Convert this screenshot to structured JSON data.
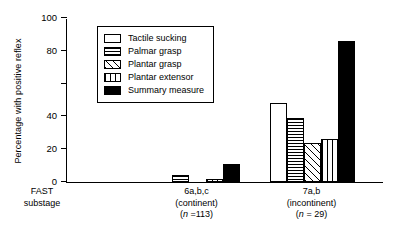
{
  "chart_data": {
    "type": "bar",
    "title": "",
    "xlabel": "FAST substage",
    "ylabel": "Percentage with positive reflex",
    "ylim": [
      0,
      100
    ],
    "yticks": [
      0,
      20,
      40,
      60,
      80,
      100
    ],
    "ytick_labels": [
      "0",
      "20",
      "40",
      "",
      "80",
      "100"
    ],
    "grid": false,
    "legend_position": "upper left",
    "categories": [
      "6a,b,c (continent) (n = 113)",
      "7a,b (incontinent) (n = 29)"
    ],
    "series": [
      {
        "name": "Tactile sucking",
        "pattern": "solid-white",
        "values": [
          0,
          48
        ]
      },
      {
        "name": "Palmar grasp",
        "pattern": "horizontal-stripe",
        "values": [
          4,
          39
        ]
      },
      {
        "name": "Plantar grasp",
        "pattern": "diagonal-stripe",
        "values": [
          0,
          24
        ]
      },
      {
        "name": "Plantar extensor",
        "pattern": "vertical-stripe",
        "values": [
          2,
          26
        ]
      },
      {
        "name": "Summary measure",
        "pattern": "solid-black",
        "values": [
          11,
          86
        ]
      }
    ]
  },
  "axis": {
    "y_title": "Percentage with positive reflex",
    "x_axis_caption_line1": "FAST",
    "x_axis_caption_line2": "substage"
  },
  "legend": {
    "items": [
      {
        "label": "Tactile sucking"
      },
      {
        "label": "Palmar grasp"
      },
      {
        "label": "Plantar grasp"
      },
      {
        "label": "Plantar extensor"
      },
      {
        "label": "Summary measure"
      }
    ]
  },
  "x_groups": [
    {
      "line1": "6a,b,c",
      "line2": "(continent)",
      "n_prefix": "(",
      "n_italic": "n",
      "n_rest": " =113)"
    },
    {
      "line1": "7a,b",
      "line2": "(incontinent)",
      "n_prefix": "(",
      "n_italic": "n",
      "n_rest": " = 29)"
    }
  ],
  "colors": {
    "axis": "#000000",
    "bar_outline": "#000000",
    "fill_black": "#000000",
    "fill_white": "#ffffff",
    "background": "#ffffff"
  }
}
